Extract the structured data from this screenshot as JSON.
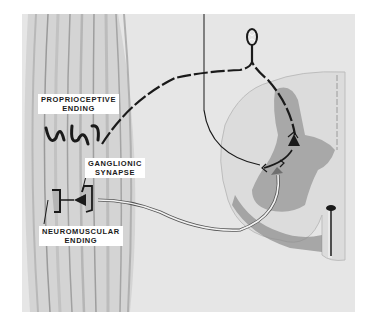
{
  "figure": {
    "type": "anatomical-illustration",
    "colors": {
      "background": "#ffffff",
      "panel": "#e6e6e6",
      "muscle_band": "#cfcfcf",
      "cord_white_matter": "#d9d9d9",
      "cord_gray_matter": "#a8a8a8",
      "nerve_dark": "#1a1a1a",
      "nerve_light": "#f2f2f2"
    }
  },
  "labels": {
    "proprioceptive": {
      "line1": "PROPRIOCEPTIVE",
      "line2": "ENDING"
    },
    "ganglionic": {
      "line1": "GANGLIONIC",
      "line2": "SYNAPSE"
    },
    "neuromuscular": {
      "line1": "NEUROMUSCULAR",
      "line2": "ENDING"
    }
  },
  "structures": [
    "muscle-fibers",
    "proprioceptive-ending",
    "sensory-nerve-fiber",
    "dorsal-root-ganglion",
    "spinal-cord-cross-section",
    "gray-matter",
    "ventral-horn-motor-neuron",
    "interneuron-synapse",
    "motor-nerve-fiber",
    "ganglionic-synapse",
    "neuromuscular-ending",
    "central-canal-fissure"
  ]
}
